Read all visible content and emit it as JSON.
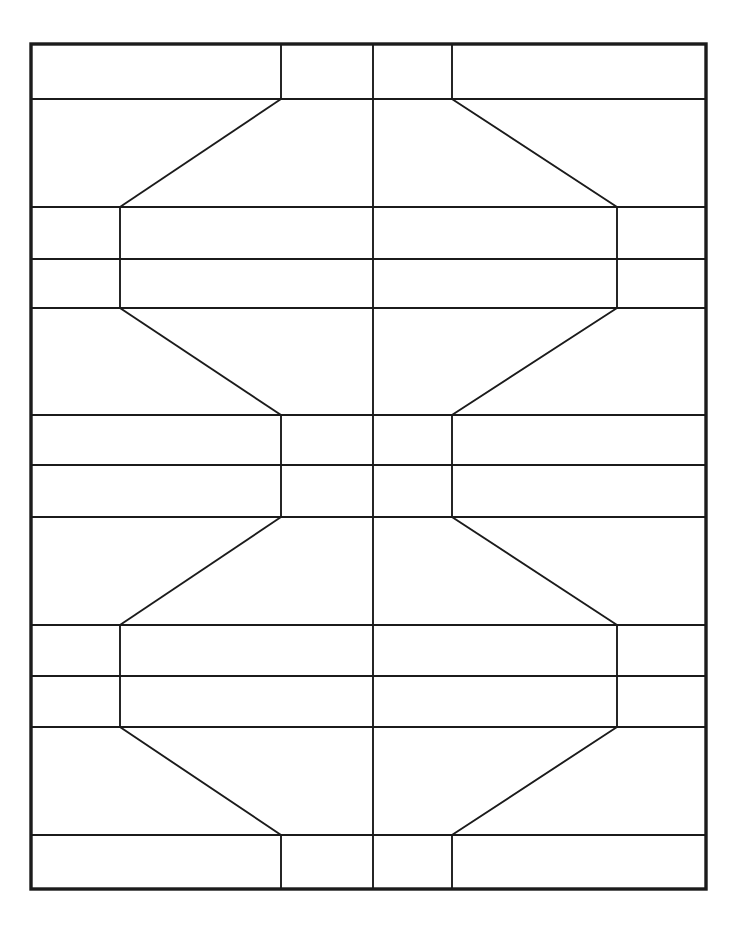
{
  "document": {
    "title": "Symmetric Grid Pattern Line Drawing",
    "background_color": "#ffffff",
    "line_color": "#1b1b1b",
    "canvas": {
      "width": 748,
      "height": 933
    }
  },
  "diagram": {
    "name": "mirror-symmetric-hourglass-grid",
    "frame": {
      "name": "outer-border",
      "left": 31,
      "top": 44,
      "right": 706,
      "bottom": 889,
      "stroke_width": 3.4
    },
    "axes": {
      "vertical_center_x": 373,
      "horizontal_center_y": 466
    },
    "horizontal_rules": [
      {
        "name": "rule-1",
        "y": 99,
        "x1": 31,
        "x2": 706
      },
      {
        "name": "rule-2",
        "y": 207,
        "x1": 31,
        "x2": 706
      },
      {
        "name": "rule-3",
        "y": 259,
        "x1": 31,
        "x2": 706
      },
      {
        "name": "rule-4",
        "y": 308,
        "x1": 31,
        "x2": 706
      },
      {
        "name": "rule-5",
        "y": 415,
        "x1": 31,
        "x2": 706
      },
      {
        "name": "rule-6",
        "y": 465,
        "x1": 31,
        "x2": 706
      },
      {
        "name": "rule-7",
        "y": 517,
        "x1": 31,
        "x2": 706
      },
      {
        "name": "rule-8",
        "y": 625,
        "x1": 31,
        "x2": 706
      },
      {
        "name": "rule-9",
        "y": 676,
        "x1": 31,
        "x2": 706
      },
      {
        "name": "rule-10",
        "y": 727,
        "x1": 31,
        "x2": 706
      },
      {
        "name": "rule-11",
        "y": 835,
        "x1": 31,
        "x2": 706
      }
    ],
    "vertical_segments": [
      {
        "name": "center-axis-line",
        "x": 373,
        "y1": 44,
        "y2": 889
      },
      {
        "name": "inner-left-top",
        "x": 281,
        "y1": 44,
        "y2": 99
      },
      {
        "name": "inner-right-top",
        "x": 452,
        "y1": 44,
        "y2": 99
      },
      {
        "name": "inner-left-middle",
        "x": 281,
        "y1": 415,
        "y2": 517
      },
      {
        "name": "inner-right-middle",
        "x": 452,
        "y1": 415,
        "y2": 517
      },
      {
        "name": "inner-left-bottom",
        "x": 281,
        "y1": 835,
        "y2": 889
      },
      {
        "name": "inner-right-bottom",
        "x": 452,
        "y1": 835,
        "y2": 889
      },
      {
        "name": "waist-left-upper",
        "x": 120,
        "y1": 207,
        "y2": 308
      },
      {
        "name": "waist-right-upper",
        "x": 617,
        "y1": 207,
        "y2": 308
      },
      {
        "name": "waist-left-lower",
        "x": 120,
        "y1": 625,
        "y2": 727
      },
      {
        "name": "waist-right-lower",
        "x": 617,
        "y1": 625,
        "y2": 727
      }
    ],
    "diagonals": [
      {
        "name": "diag-upper-outer-left-top",
        "x1": 281,
        "y1": 99,
        "x2": 120,
        "y2": 207
      },
      {
        "name": "diag-upper-outer-right-top",
        "x1": 452,
        "y1": 99,
        "x2": 617,
        "y2": 207
      },
      {
        "name": "diag-upper-outer-left-bottom",
        "x1": 120,
        "y1": 308,
        "x2": 281,
        "y2": 415
      },
      {
        "name": "diag-upper-outer-right-bottom",
        "x1": 617,
        "y1": 308,
        "x2": 452,
        "y2": 415
      },
      {
        "name": "diag-lower-outer-left-top",
        "x1": 281,
        "y1": 517,
        "x2": 120,
        "y2": 625
      },
      {
        "name": "diag-lower-outer-right-top",
        "x1": 452,
        "y1": 517,
        "x2": 617,
        "y2": 625
      },
      {
        "name": "diag-lower-outer-left-bottom",
        "x1": 120,
        "y1": 727,
        "x2": 281,
        "y2": 835
      },
      {
        "name": "diag-lower-outer-right-bottom",
        "x1": 617,
        "y1": 727,
        "x2": 452,
        "y2": 835
      }
    ],
    "band_count": 12,
    "symmetry": "bilateral vertical and horizontal"
  }
}
